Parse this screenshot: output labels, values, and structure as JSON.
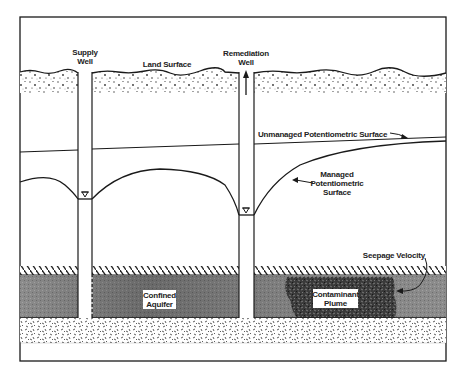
{
  "diagram": {
    "title": "",
    "labels": {
      "supply_well_line1": "Supply",
      "supply_well_line2": "Well",
      "land_surface": "Land Surface",
      "remediation_well_line1": "Remediation",
      "remediation_well_line2": "Well",
      "unmanaged_surface": "Unmanaged Potentiometric Surface",
      "managed_surface_line1": "Managed",
      "managed_surface_line2": "Potentiometric",
      "managed_surface_line3": "Surface",
      "seepage_velocity": "Seepage Velocity",
      "confined_aquifer_line1": "Confined",
      "confined_aquifer_line2": "Aquifer",
      "contaminant_plume_line1": "Contaminant",
      "contaminant_plume_line2": "Plume"
    },
    "elements": [
      {
        "name": "land-surface-soil",
        "type": "stippled-layer"
      },
      {
        "name": "supply-well",
        "type": "well"
      },
      {
        "name": "remediation-well",
        "type": "well",
        "flow": "upward-arrow"
      },
      {
        "name": "unmanaged-potentiometric-surface",
        "type": "line"
      },
      {
        "name": "managed-potentiometric-surface",
        "type": "curve",
        "shape": "cones-of-depression"
      },
      {
        "name": "water-level-marker-supply",
        "type": "inverted-triangle"
      },
      {
        "name": "water-level-marker-remediation",
        "type": "inverted-triangle"
      },
      {
        "name": "confining-layer",
        "type": "hatched-layer"
      },
      {
        "name": "confined-aquifer",
        "type": "shaded-layer"
      },
      {
        "name": "contaminant-plume",
        "type": "dark-speckled-region"
      },
      {
        "name": "bedrock-base",
        "type": "stippled-layer"
      }
    ],
    "colors": {
      "line": "#1a1a1a",
      "aquifer": "#8a8a8a",
      "aquifer_dark": "#5a5a5a",
      "plume": "#2a2a2a",
      "background": "#ffffff"
    }
  }
}
